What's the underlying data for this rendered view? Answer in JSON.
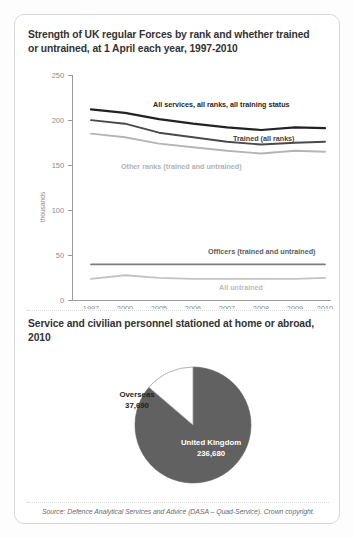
{
  "page": {
    "background": "#fdfdfd",
    "card_background": "#ffffff",
    "card_border": "#d8d8d8"
  },
  "line_section": {
    "title": "Strength of UK regular Forces by rank and whether trained or untrained, at 1 April each year, 1997-2010"
  },
  "pie_section": {
    "title": "Service and civilian personnel stationed at home or abroad, 2010"
  },
  "source": {
    "text": "Source: Defence Analytical Services and Advice (DASA – Quad-Service). Crown copyright."
  },
  "chart_data": [
    {
      "type": "line",
      "title": "Strength of UK regular Forces by rank and whether trained or untrained, at 1 April each year, 1997-2010",
      "xlabel": "",
      "ylabel": "thousands",
      "categories": [
        "1997",
        "2000",
        "2005",
        "2006",
        "2007",
        "2008",
        "2009",
        "2010"
      ],
      "yticks": [
        0,
        50,
        100,
        150,
        200,
        250
      ],
      "ylim": [
        0,
        250
      ],
      "grid": false,
      "legend": "inline-labels",
      "series": [
        {
          "name": "All services, all ranks, all training status",
          "color": "#222222",
          "label_color": "#1f1f1f",
          "values": [
            212,
            208,
            201,
            196,
            192,
            189,
            192,
            191
          ]
        },
        {
          "name": "Trained (all ranks)",
          "color": "#4a4a4a",
          "label_color": "#3f3f3f",
          "values": [
            200,
            196,
            186,
            181,
            176,
            173,
            175,
            176
          ]
        },
        {
          "name": "Other ranks (trained and untrained)",
          "color": "#b5b5b5",
          "label_color": "#b2b2b2",
          "values": [
            185,
            181,
            174,
            170,
            166,
            163,
            166,
            165
          ]
        },
        {
          "name": "Officers (trained and untrained)",
          "color": "#7d7d7d",
          "label_color": "#5c5c5c",
          "values": [
            40,
            40,
            40,
            40,
            40,
            40,
            40,
            40
          ]
        },
        {
          "name": "All untrained",
          "color": "#c3c3c3",
          "label_color": "#bdbdbd",
          "values": [
            24,
            28,
            25,
            24,
            24,
            24,
            24,
            25
          ]
        }
      ]
    },
    {
      "type": "pie",
      "title": "Service and civilian personnel stationed at home or abroad, 2010",
      "labels": [
        "United Kingdom",
        "Overseas"
      ],
      "values": [
        236680,
        37690
      ],
      "value_labels": [
        "236,680",
        "37,690"
      ],
      "colors": [
        "#616161",
        "#ffffff"
      ],
      "total": 274370,
      "legend": "in-slice"
    }
  ]
}
